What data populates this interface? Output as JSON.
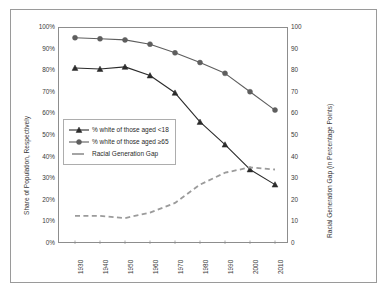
{
  "chart_data": {
    "type": "line",
    "title": "",
    "xlabel": "",
    "ylabel": "Share of Population, Respectively",
    "y2label": "Racial Generation Gap (in Percentage Points)",
    "categories": [
      "1930",
      "1940",
      "1950",
      "1960",
      "1970",
      "1980",
      "1990",
      "2000",
      "2010"
    ],
    "x": [
      1930,
      1940,
      1950,
      1960,
      1970,
      1980,
      1990,
      2000,
      2010
    ],
    "ylim": [
      0,
      100
    ],
    "y2lim": [
      0,
      100
    ],
    "yticks": [
      "0%",
      "10%",
      "20%",
      "30%",
      "40%",
      "50%",
      "60%",
      "70%",
      "80%",
      "90%",
      "100%"
    ],
    "ytick_values": [
      0,
      10,
      20,
      30,
      40,
      50,
      60,
      70,
      80,
      90,
      100
    ],
    "y2ticks": [
      "0",
      "10",
      "20",
      "30",
      "40",
      "50",
      "60",
      "70",
      "80",
      "90",
      "100"
    ],
    "y2tick_values": [
      0,
      10,
      20,
      30,
      40,
      50,
      60,
      70,
      80,
      90,
      100
    ],
    "grid": false,
    "legend_position": "inside-left",
    "series": [
      {
        "name": "% white of those aged <18",
        "axis": "left",
        "marker": "triangle",
        "linestyle": "solid",
        "color": "#2b2b2b",
        "values": [
          81.5,
          81.0,
          82.0,
          78.0,
          70.0,
          56.5,
          46.0,
          34.5,
          27.5
        ]
      },
      {
        "name": "% white of those aged ≥65",
        "axis": "left",
        "marker": "circle",
        "linestyle": "solid",
        "color": "#5e5e5e",
        "values": [
          95.5,
          95.0,
          94.5,
          92.5,
          88.5,
          84.0,
          79.0,
          70.5,
          62.0
        ]
      },
      {
        "name": "Racial Generation Gap",
        "axis": "right",
        "marker": "none",
        "linestyle": "dashed",
        "color": "#9b9b9b",
        "values": [
          13.0,
          13.0,
          12.0,
          14.5,
          19.0,
          27.5,
          33.0,
          35.5,
          34.5
        ]
      }
    ]
  },
  "legend": {
    "items": [
      {
        "label": "% white of those aged <18"
      },
      {
        "label": "% white of those aged ≥65"
      },
      {
        "label": "Racial Generation Gap"
      }
    ]
  },
  "colors": {
    "series_under18": "#2b2b2b",
    "series_over65": "#5e5e5e",
    "series_gap": "#9b9b9b",
    "frame": "#8d8d8d",
    "outer_frame": "#9a9a9a",
    "text": "#3a3a3a",
    "background": "#ffffff"
  }
}
